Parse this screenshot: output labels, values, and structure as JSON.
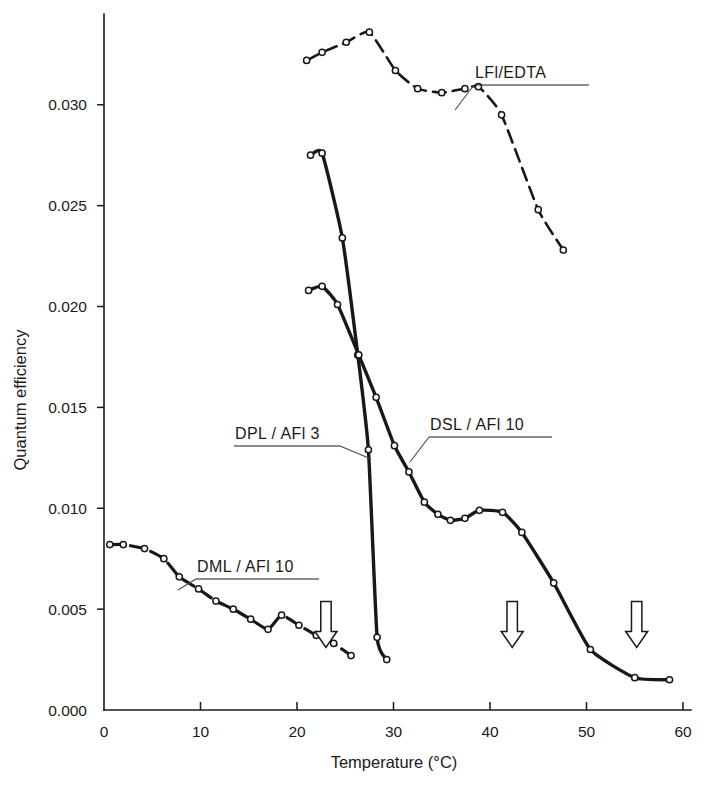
{
  "chart_data": {
    "type": "line",
    "title": "",
    "xlabel": "Temperature (°C)",
    "ylabel": "Quantum efficiency",
    "xlim": [
      0,
      60
    ],
    "ylim": [
      0.0,
      0.0345
    ],
    "grid": false,
    "legend_position": "inline-annotations",
    "xticks": [
      0,
      10,
      20,
      30,
      40,
      50,
      60
    ],
    "xtick_labels": [
      "0",
      "10",
      "20",
      "30",
      "40",
      "50",
      "60"
    ],
    "yticks": [
      0.0,
      0.005,
      0.01,
      0.015,
      0.02,
      0.025,
      0.03
    ],
    "ytick_labels": [
      "0.000",
      "0.005",
      "0.010",
      "0.015",
      "0.020",
      "0.025",
      "0.030"
    ],
    "marker": "open-circle",
    "series": [
      {
        "name": "LFl/EDTA",
        "label": "LFl/EDTA",
        "x": [
          21.0,
          22.6,
          25.1,
          27.5,
          30.2,
          32.5,
          35.0,
          37.4,
          38.8,
          41.2,
          45.0,
          47.6
        ],
        "y": [
          0.0322,
          0.0326,
          0.0331,
          0.0336,
          0.0317,
          0.0308,
          0.0306,
          0.0308,
          0.0309,
          0.0295,
          0.0248,
          0.0228
        ]
      },
      {
        "name": "DPL/AFl 3",
        "label": "DPL / AFl 3",
        "x": [
          21.4,
          22.6,
          24.7,
          26.3,
          27.4,
          28.3,
          29.3
        ],
        "y": [
          0.0275,
          0.0276,
          0.0234,
          0.0176,
          0.0129,
          0.0036,
          0.0025
        ]
      },
      {
        "name": "DSL/AFl 10",
        "label": "DSL / AFl 10",
        "x": [
          21.2,
          22.6,
          24.2,
          26.4,
          28.2,
          30.1,
          31.6,
          33.2,
          34.6,
          35.9,
          37.4,
          38.9,
          41.3,
          43.3,
          46.6,
          50.4,
          55.0,
          58.6
        ],
        "y": [
          0.0208,
          0.021,
          0.0201,
          0.0176,
          0.0155,
          0.0131,
          0.0118,
          0.0103,
          0.0097,
          0.0094,
          0.0095,
          0.0099,
          0.0098,
          0.0088,
          0.0063,
          0.003,
          0.0016,
          0.0015
        ]
      },
      {
        "name": "DML/AFl 10",
        "label": "DML / AFl 10",
        "x": [
          0.6,
          2.0,
          4.2,
          6.2,
          7.8,
          9.8,
          11.6,
          13.4,
          15.2,
          17.0,
          18.4,
          20.2,
          22.0,
          23.8,
          25.6
        ],
        "y": [
          0.0082,
          0.0082,
          0.008,
          0.0075,
          0.0066,
          0.006,
          0.0054,
          0.005,
          0.0045,
          0.004,
          0.0047,
          0.0042,
          0.0037,
          0.0033,
          0.0027
        ]
      }
    ],
    "annotations": [
      {
        "name": "transition-arrow-1",
        "x": 23.0,
        "y": 0.0035,
        "glyph": "down-arrow"
      },
      {
        "name": "transition-arrow-2",
        "x": 42.3,
        "y": 0.0035,
        "glyph": "down-arrow"
      },
      {
        "name": "transition-arrow-3",
        "x": 55.2,
        "y": 0.0035,
        "glyph": "down-arrow"
      }
    ]
  },
  "labels": {
    "lfl_edta": "LFl/EDTA",
    "dpl_afl3": "DPL / AFl 3",
    "dsl_afl10": "DSL / AFl 10",
    "dml_afl10": "DML / AFl 10"
  },
  "axis": {
    "x_title": "Temperature (°C)",
    "y_title": "Quantum efficiency"
  }
}
